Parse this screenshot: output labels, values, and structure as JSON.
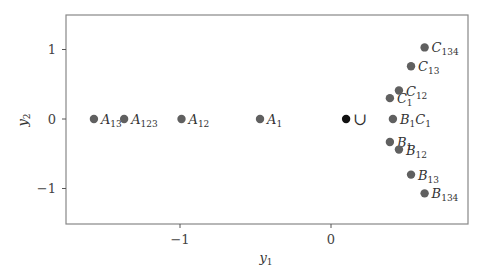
{
  "chart_data": {
    "type": "scatter",
    "title": "",
    "xlabel": "y1",
    "ylabel": "y2",
    "xlim": [
      -1.76,
      0.9
    ],
    "ylim": [
      -1.5,
      1.5
    ],
    "xticks": [
      -1,
      0
    ],
    "yticks": [
      -1,
      0,
      1
    ],
    "xtick_labels": [
      "−1",
      "0"
    ],
    "ytick_labels": [
      "−1",
      "0",
      "1"
    ],
    "grid": false,
    "legend": null,
    "colors": {
      "point": "#606060",
      "highlight": "#111111",
      "axis": "#888888"
    },
    "points": [
      {
        "label": "A13",
        "base": "A",
        "sub": "13",
        "x": -1.57,
        "y": 0.0,
        "color": "#606060"
      },
      {
        "label": "A123",
        "base": "A",
        "sub": "123",
        "x": -1.37,
        "y": 0.0,
        "color": "#606060"
      },
      {
        "label": "A12",
        "base": "A",
        "sub": "12",
        "x": -0.99,
        "y": 0.0,
        "color": "#606060"
      },
      {
        "label": "A1",
        "base": "A",
        "sub": "1",
        "x": -0.47,
        "y": 0.0,
        "color": "#606060"
      },
      {
        "label": "∪",
        "base": "∪",
        "sub": "",
        "x": 0.1,
        "y": 0.0,
        "color": "#111111"
      },
      {
        "label": "B1C1",
        "base": "B",
        "sub": "1",
        "base2": "C",
        "sub2": "1",
        "x": 0.41,
        "y": 0.0,
        "color": "#606060"
      },
      {
        "label": "C1",
        "base": "C",
        "sub": "1",
        "x": 0.39,
        "y": 0.3,
        "color": "#606060"
      },
      {
        "label": "C12",
        "base": "C",
        "sub": "12",
        "x": 0.45,
        "y": 0.41,
        "color": "#606060"
      },
      {
        "label": "C13",
        "base": "C",
        "sub": "13",
        "x": 0.53,
        "y": 0.76,
        "color": "#606060"
      },
      {
        "label": "C134",
        "base": "C",
        "sub": "134",
        "x": 0.62,
        "y": 1.03,
        "color": "#606060"
      },
      {
        "label": "B1",
        "base": "B",
        "sub": "1",
        "x": 0.39,
        "y": -0.33,
        "color": "#606060"
      },
      {
        "label": "B12",
        "base": "B",
        "sub": "12",
        "x": 0.45,
        "y": -0.44,
        "color": "#606060"
      },
      {
        "label": "B13",
        "base": "B",
        "sub": "13",
        "x": 0.53,
        "y": -0.8,
        "color": "#606060"
      },
      {
        "label": "B134",
        "base": "B",
        "sub": "134",
        "x": 0.62,
        "y": -1.07,
        "color": "#606060"
      }
    ]
  }
}
